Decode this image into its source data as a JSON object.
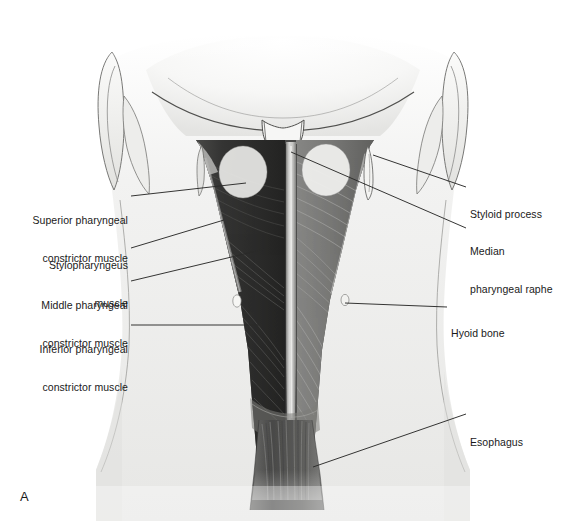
{
  "figure": {
    "panel_letter": "A",
    "caption": "",
    "background_color": "#ffffff",
    "ink_color": "#1a1a1a"
  },
  "labels": {
    "left": [
      {
        "id": "superior-pharyngeal-constrictor-muscle",
        "lines": [
          "Superior pharyngeal",
          "constrictor muscle"
        ],
        "x": 18,
        "y": 189,
        "width": 110
      },
      {
        "id": "stylopharyngeus-muscle",
        "lines": [
          "Stylopharyngeus",
          "muscle"
        ],
        "x": 18,
        "y": 234,
        "width": 110
      },
      {
        "id": "middle-pharyngeal-constrictor-muscle",
        "lines": [
          "Middle pharyngeal",
          "constrictor muscle"
        ],
        "x": 18,
        "y": 274,
        "width": 110
      },
      {
        "id": "inferior-pharyngeal-constrictor-muscle",
        "lines": [
          "Inferior pharyngeal",
          "constrictor muscle"
        ],
        "x": 18,
        "y": 318,
        "width": 110
      }
    ],
    "right": [
      {
        "id": "styloid-process",
        "lines": [
          "Styloid process"
        ],
        "x": 470,
        "y": 183,
        "width": 95
      },
      {
        "id": "median-pharyngeal-raphe",
        "lines": [
          "Median",
          "pharyngeal raphe"
        ],
        "x": 470,
        "y": 220,
        "width": 95
      },
      {
        "id": "hyoid-bone",
        "lines": [
          "Hyoid bone"
        ],
        "x": 451,
        "y": 302,
        "width": 95
      },
      {
        "id": "esophagus",
        "lines": [
          "Esophagus"
        ],
        "x": 470,
        "y": 411,
        "width": 95
      }
    ]
  },
  "leaders": {
    "superior-pharyngeal-constrictor-muscle": {
      "x1": 131,
      "y1": 196,
      "x2": 246,
      "y2": 183
    },
    "stylopharyngeus-muscle": {
      "x1": 131,
      "y1": 248,
      "x2": 224,
      "y2": 220
    },
    "middle-pharyngeal-constrictor-muscle": {
      "x1": 131,
      "y1": 281,
      "x2": 265,
      "y2": 249
    },
    "inferior-pharyngeal-constrictor-muscle": {
      "x1": 131,
      "y1": 325,
      "x2": 262,
      "y2": 325
    },
    "styloid-process": {
      "x1": 466,
      "y1": 187,
      "x2": 373,
      "y2": 155
    },
    "median-pharyngeal-raphe": {
      "x1": 466,
      "y1": 228,
      "x2": 291,
      "y2": 152
    },
    "hyoid-bone": {
      "x1": 447,
      "y1": 307,
      "x2": 345,
      "y2": 303
    },
    "esophagus": {
      "x1": 466,
      "y1": 414,
      "x2": 313,
      "y2": 467
    }
  },
  "anatomy": {
    "structures": [
      {
        "id": "skull-base",
        "label": "Skull base / occipital bone"
      },
      {
        "id": "mastoid-process-left",
        "label": "Mastoid process (left)"
      },
      {
        "id": "mastoid-process-right",
        "label": "Mastoid process (right)"
      },
      {
        "id": "styloid-process-spike",
        "label": "Styloid process"
      },
      {
        "id": "median-raphe-band",
        "label": "Median pharyngeal raphe"
      },
      {
        "id": "superior-constrictor-sheet",
        "label": "Superior pharyngeal constrictor"
      },
      {
        "id": "middle-constrictor-sheet",
        "label": "Middle pharyngeal constrictor"
      },
      {
        "id": "inferior-constrictor-sheet",
        "label": "Inferior pharyngeal constrictor"
      },
      {
        "id": "hyoid-horn-left",
        "label": "Greater horn of hyoid (left)"
      },
      {
        "id": "hyoid-horn-right",
        "label": "Greater horn of hyoid (right)"
      },
      {
        "id": "esophagus-tube",
        "label": "Esophagus"
      },
      {
        "id": "neck-skin-contour",
        "label": "Neck soft tissue outline"
      }
    ],
    "palette": {
      "skin": "#e8e8e6",
      "skin_shadow": "#d2d2d0",
      "bone": "#f2f1ee",
      "bone_line": "#555555",
      "muscle_light": "#9a9a98",
      "muscle_mid": "#6d6d6b",
      "muscle_dark": "#3a3a39",
      "muscle_darkest": "#252524",
      "raphe": "#cfcfcd",
      "outline": "#4a4a4a"
    }
  }
}
